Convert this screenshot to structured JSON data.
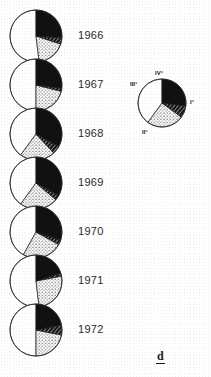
{
  "figure": {
    "letter": "d",
    "width": 211,
    "height": 377,
    "background": "#ffffff",
    "ink_color": "#111111"
  },
  "series_label_header": "",
  "years": [
    {
      "label": "1966",
      "cx": 36,
      "cy": 36,
      "r": 26
    },
    {
      "label": "1967",
      "cx": 36,
      "cy": 85,
      "r": 26
    },
    {
      "label": "1968",
      "cx": 36,
      "cy": 134,
      "r": 26
    },
    {
      "label": "1969",
      "cx": 36,
      "cy": 183,
      "r": 26
    },
    {
      "label": "1970",
      "cx": 36,
      "cy": 232,
      "r": 26
    },
    {
      "label": "1971",
      "cx": 36,
      "cy": 281,
      "r": 26
    },
    {
      "label": "1972",
      "cx": 36,
      "cy": 330,
      "r": 26
    }
  ],
  "legend": {
    "cx": 162,
    "cy": 103,
    "r": 24,
    "labels": [
      {
        "text": "IV°",
        "x": 155,
        "y": 74
      },
      {
        "text": "III°",
        "x": 130,
        "y": 85
      },
      {
        "text": "I°",
        "x": 190,
        "y": 103
      },
      {
        "text": "II°",
        "x": 142,
        "y": 133
      }
    ]
  },
  "chart_data": {
    "type": "pie",
    "title": "",
    "subtitle": "",
    "xlabel": "",
    "ylabel": "",
    "legend_position": "right",
    "categories": [
      "I°",
      "II°",
      "III°",
      "IV°"
    ],
    "category_styles": [
      "white",
      "stippled",
      "hatched",
      "black"
    ],
    "category_colors": [
      "#ffffff",
      "#dddddd",
      "#555555",
      "#111111"
    ],
    "charts": [
      {
        "name": "1966",
        "values": [
          52,
          18,
          4,
          26
        ],
        "slices": [
          {
            "category": "I°",
            "start_deg": 0,
            "end_deg": 187,
            "style": "white"
          },
          {
            "category": "II°",
            "start_deg": 187,
            "end_deg": 252,
            "style": "stippled"
          },
          {
            "category": "III°",
            "start_deg": 252,
            "end_deg": 266,
            "style": "hatched"
          },
          {
            "category": "IV°",
            "start_deg": 266,
            "end_deg": 360,
            "style": "black"
          }
        ]
      },
      {
        "name": "1967",
        "values": [
          50,
          21,
          2,
          27
        ],
        "slices": [
          {
            "category": "I°",
            "start_deg": 0,
            "end_deg": 180,
            "style": "white"
          },
          {
            "category": "II°",
            "start_deg": 180,
            "end_deg": 256,
            "style": "stippled"
          },
          {
            "category": "III°",
            "start_deg": 256,
            "end_deg": 263,
            "style": "hatched"
          },
          {
            "category": "IV°",
            "start_deg": 263,
            "end_deg": 360,
            "style": "black"
          }
        ]
      },
      {
        "name": "1968",
        "values": [
          40,
          22,
          5,
          33
        ],
        "slices": [
          {
            "category": "I°",
            "start_deg": 0,
            "end_deg": 144,
            "style": "white"
          },
          {
            "category": "II°",
            "start_deg": 144,
            "end_deg": 223,
            "style": "stippled"
          },
          {
            "category": "III°",
            "start_deg": 223,
            "end_deg": 241,
            "style": "hatched"
          },
          {
            "category": "IV°",
            "start_deg": 241,
            "end_deg": 360,
            "style": "black"
          }
        ]
      },
      {
        "name": "1969",
        "values": [
          40,
          24,
          3,
          33
        ],
        "slices": [
          {
            "category": "I°",
            "start_deg": 0,
            "end_deg": 144,
            "style": "white"
          },
          {
            "category": "II°",
            "start_deg": 144,
            "end_deg": 230,
            "style": "stippled"
          },
          {
            "category": "III°",
            "start_deg": 230,
            "end_deg": 241,
            "style": "hatched"
          },
          {
            "category": "IV°",
            "start_deg": 241,
            "end_deg": 360,
            "style": "black"
          }
        ]
      },
      {
        "name": "1970",
        "values": [
          42,
          25,
          3,
          30
        ],
        "slices": [
          {
            "category": "I°",
            "start_deg": 0,
            "end_deg": 151,
            "style": "white"
          },
          {
            "category": "II°",
            "start_deg": 151,
            "end_deg": 241,
            "style": "stippled"
          },
          {
            "category": "III°",
            "start_deg": 241,
            "end_deg": 252,
            "style": "hatched"
          },
          {
            "category": "IV°",
            "start_deg": 252,
            "end_deg": 360,
            "style": "black"
          }
        ]
      },
      {
        "name": "1971",
        "values": [
          52,
          26,
          2,
          20
        ],
        "slices": [
          {
            "category": "I°",
            "start_deg": 0,
            "end_deg": 187,
            "style": "white"
          },
          {
            "category": "II°",
            "start_deg": 187,
            "end_deg": 281,
            "style": "stippled"
          },
          {
            "category": "III°",
            "start_deg": 281,
            "end_deg": 288,
            "style": "hatched"
          },
          {
            "category": "IV°",
            "start_deg": 288,
            "end_deg": 360,
            "style": "black"
          }
        ]
      },
      {
        "name": "1972",
        "values": [
          50,
          22,
          6,
          22
        ],
        "slices": [
          {
            "category": "I°",
            "start_deg": 0,
            "end_deg": 180,
            "style": "white"
          },
          {
            "category": "II°",
            "start_deg": 180,
            "end_deg": 259,
            "style": "stippled"
          },
          {
            "category": "III°",
            "start_deg": 259,
            "end_deg": 281,
            "style": "hatched"
          },
          {
            "category": "IV°",
            "start_deg": 281,
            "end_deg": 360,
            "style": "black"
          }
        ]
      },
      {
        "name": "legend",
        "values": [
          40,
          25,
          8,
          27
        ],
        "slices": [
          {
            "category": "I°",
            "start_deg": 0,
            "end_deg": 144,
            "style": "white"
          },
          {
            "category": "II°",
            "start_deg": 144,
            "end_deg": 234,
            "style": "stippled"
          },
          {
            "category": "III°",
            "start_deg": 234,
            "end_deg": 263,
            "style": "hatched"
          },
          {
            "category": "IV°",
            "start_deg": 263,
            "end_deg": 360,
            "style": "black"
          }
        ]
      }
    ]
  }
}
